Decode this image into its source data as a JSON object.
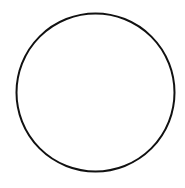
{
  "diagram": {
    "shapes": [
      {
        "type": "circle",
        "cx": 95.5,
        "cy": 92.5,
        "r": 79,
        "stroke": "#111111",
        "stroke_width": 2,
        "fill": "#ffffff"
      }
    ],
    "background": "#ffffff"
  }
}
